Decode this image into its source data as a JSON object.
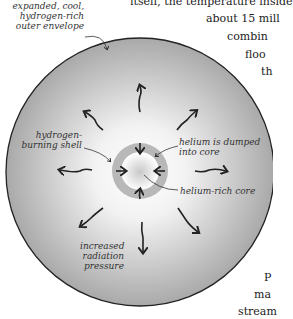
{
  "labels": {
    "envelope": [
      "expanded, cool,",
      "hydrogen-rich",
      "outer envelope"
    ],
    "shell": [
      "hydrogen-",
      "burning shell"
    ],
    "dumped": [
      "helium is dumped",
      "into core"
    ],
    "core": "helium-rich core",
    "pressure": [
      "increased",
      "radiation",
      "pressure"
    ]
  },
  "body_text": {
    "lines_top": [
      "itself, the temperature inside",
      "about 15 mill",
      "combin",
      "floo",
      "th"
    ],
    "lines_bottom": [
      "P",
      "ma",
      "stream"
    ]
  },
  "colors": {
    "outline": "#222222",
    "shell_ring": "#b8b8b8",
    "envelope_edge": "#a8a8a8"
  }
}
